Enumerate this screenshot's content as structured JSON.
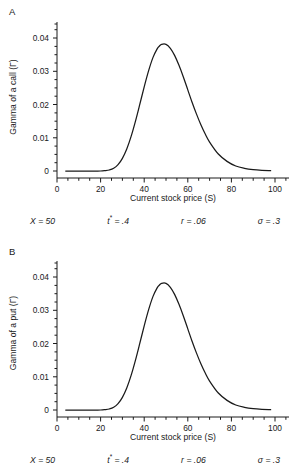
{
  "figure": {
    "panels": [
      {
        "letter": "A",
        "ylabel": "Gamma of a call (Γ)",
        "xlabel": "Current stock price (S)",
        "params": [
          {
            "name": "X",
            "sup": "",
            "eq": "= 50"
          },
          {
            "name": "t",
            "sup": "*",
            "eq": "= .4"
          },
          {
            "name": "r",
            "sup": "",
            "eq": "= .06"
          },
          {
            "name": "σ",
            "sup": "",
            "eq": "= .3"
          }
        ]
      },
      {
        "letter": "B",
        "ylabel": "Gamma of a put (Γ)",
        "xlabel": "Current stock price (S)",
        "params": [
          {
            "name": "X",
            "sup": "",
            "eq": "= 50"
          },
          {
            "name": "t",
            "sup": "*",
            "eq": "= .4"
          },
          {
            "name": "r",
            "sup": "",
            "eq": "= .06"
          },
          {
            "name": "σ",
            "sup": "",
            "eq": "= .3"
          }
        ]
      }
    ]
  },
  "chart_data": [
    {
      "type": "line",
      "title": "A",
      "xlabel": "Current stock price (S)",
      "ylabel": "Gamma of a call (Γ)",
      "xlim": [
        0,
        105
      ],
      "ylim": [
        0,
        0.047
      ],
      "xticks": [
        0,
        20,
        40,
        60,
        80,
        100
      ],
      "xtick_labels": [
        "0",
        "20",
        "40",
        "60",
        "80",
        "100"
      ],
      "xminor_step": 5,
      "yticks": [
        0,
        0.01,
        0.02,
        0.03,
        0.04
      ],
      "ytick_labels": [
        "0",
        "0.01",
        "0.02",
        "0.03",
        "0.04"
      ],
      "yminor_step": 0.0025,
      "grid": false,
      "legend": false,
      "annotations": [
        "X = 50",
        "t* = .4",
        "r = .06",
        "σ = .3"
      ],
      "series": [
        {
          "name": "Gamma of a call",
          "x": [
            4,
            8,
            12,
            16,
            20,
            22,
            24,
            26,
            28,
            30,
            32,
            34,
            36,
            38,
            40,
            42,
            44,
            46,
            47,
            48,
            50,
            52,
            54,
            56,
            58,
            60,
            62,
            64,
            66,
            68,
            70,
            74,
            78,
            82,
            86,
            90,
            94,
            98
          ],
          "y": [
            0.0,
            0.0,
            0.0,
            0.0,
            0.0,
            0.0001,
            0.0003,
            0.0008,
            0.0019,
            0.0038,
            0.0066,
            0.0104,
            0.015,
            0.0201,
            0.0253,
            0.0301,
            0.0341,
            0.0368,
            0.0376,
            0.0381,
            0.0381,
            0.0369,
            0.0347,
            0.0317,
            0.0282,
            0.0244,
            0.0206,
            0.0171,
            0.0139,
            0.0111,
            0.0087,
            0.0051,
            0.0029,
            0.0015,
            0.0008,
            0.0004,
            0.0002,
            0.0001
          ]
        }
      ],
      "peak": {
        "x": 47.5,
        "y": 0.0438
      }
    },
    {
      "type": "line",
      "title": "B",
      "xlabel": "Current stock price (S)",
      "ylabel": "Gamma of a put (Γ)",
      "xlim": [
        0,
        105
      ],
      "ylim": [
        0,
        0.047
      ],
      "xticks": [
        0,
        20,
        40,
        60,
        80,
        100
      ],
      "xtick_labels": [
        "0",
        "20",
        "40",
        "60",
        "80",
        "100"
      ],
      "xminor_step": 5,
      "yticks": [
        0,
        0.01,
        0.02,
        0.03,
        0.04
      ],
      "ytick_labels": [
        "0",
        "0.01",
        "0.02",
        "0.03",
        "0.04"
      ],
      "yminor_step": 0.0025,
      "grid": false,
      "legend": false,
      "annotations": [
        "X = 50",
        "t* = .4",
        "r = .06",
        "σ = .3"
      ],
      "series": [
        {
          "name": "Gamma of a put",
          "x": [
            4,
            8,
            12,
            16,
            20,
            22,
            24,
            26,
            28,
            30,
            32,
            34,
            36,
            38,
            40,
            42,
            44,
            46,
            47,
            48,
            50,
            52,
            54,
            56,
            58,
            60,
            62,
            64,
            66,
            68,
            70,
            74,
            78,
            82,
            86,
            90,
            94,
            98
          ],
          "y": [
            0.0,
            0.0,
            0.0,
            0.0,
            0.0,
            0.0001,
            0.0003,
            0.0008,
            0.0019,
            0.0038,
            0.0066,
            0.0104,
            0.015,
            0.0201,
            0.0253,
            0.0301,
            0.0341,
            0.0368,
            0.0376,
            0.0381,
            0.0381,
            0.0369,
            0.0347,
            0.0317,
            0.0282,
            0.0244,
            0.0206,
            0.0171,
            0.0139,
            0.0111,
            0.0087,
            0.0051,
            0.0029,
            0.0015,
            0.0008,
            0.0004,
            0.0002,
            0.0001
          ]
        }
      ],
      "peak": {
        "x": 47.5,
        "y": 0.0438
      }
    }
  ]
}
